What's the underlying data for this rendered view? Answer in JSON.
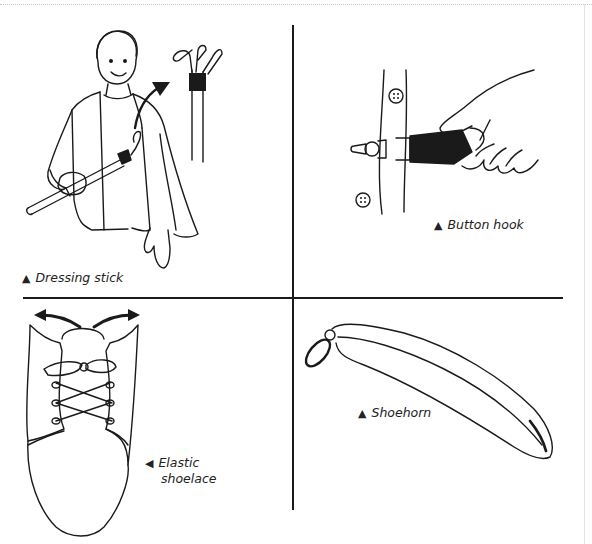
{
  "figure": {
    "panels": [
      {
        "id": "dressing-stick",
        "caption": "Dressing stick",
        "marker": "▲"
      },
      {
        "id": "button-hook",
        "caption": "Button hook",
        "marker": "▲"
      },
      {
        "id": "elastic-shoelace",
        "caption_line1": "Elastic",
        "caption_line2": "shoelace",
        "marker": "◀"
      },
      {
        "id": "shoehorn",
        "caption": "Shoehorn",
        "marker": "▲"
      }
    ],
    "colors": {
      "ink": "#1a1a1a",
      "background": "#ffffff"
    }
  }
}
